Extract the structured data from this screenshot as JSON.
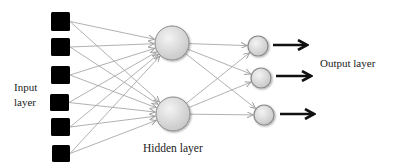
{
  "diagram": {
    "labels": {
      "input": "Input layer",
      "input_line1": "Input",
      "input_line2": "layer",
      "hidden": "Hidden layer",
      "output": "Output layer"
    },
    "colors": {
      "input_node": "#000000",
      "node_fill_light": "#f2f2f2",
      "node_fill_dark": "#c9c9c9",
      "node_stroke": "#8a8a8a",
      "connection": "#a8a8a8",
      "output_arrow": "#111111"
    },
    "input_nodes": [
      {
        "x": 51,
        "y": 12,
        "w": 19,
        "h": 19
      },
      {
        "x": 51,
        "y": 38,
        "w": 19,
        "h": 18
      },
      {
        "x": 51,
        "y": 66,
        "w": 19,
        "h": 18
      },
      {
        "x": 50,
        "y": 94,
        "w": 19,
        "h": 17
      },
      {
        "x": 51,
        "y": 118,
        "w": 19,
        "h": 18
      },
      {
        "x": 52,
        "y": 145,
        "w": 18,
        "h": 17
      }
    ],
    "hidden_nodes": [
      {
        "cx": 172,
        "cy": 43,
        "r": 17
      },
      {
        "cx": 173,
        "cy": 114,
        "r": 17
      }
    ],
    "output_nodes": [
      {
        "cx": 258,
        "cy": 46,
        "r": 10
      },
      {
        "cx": 261,
        "cy": 78,
        "r": 10
      },
      {
        "cx": 264,
        "cy": 115,
        "r": 10
      }
    ],
    "output_arrows": [
      {
        "x1": 273,
        "y1": 45,
        "x2": 307
      },
      {
        "x1": 276,
        "y1": 76,
        "x2": 311
      },
      {
        "x1": 280,
        "y1": 114,
        "x2": 314
      }
    ]
  }
}
